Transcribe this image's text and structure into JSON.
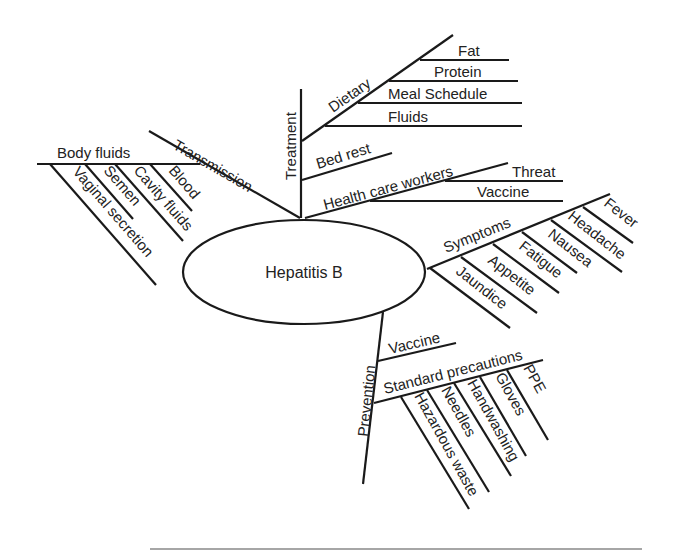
{
  "diagram": {
    "type": "mind-map",
    "center": {
      "label": "Hepatitis B"
    },
    "branches": {
      "transmission": {
        "label": "Transmission",
        "children": {
          "body_fluids": {
            "label": "Body fluids",
            "items": [
              "Vaginal secretion",
              "Semen",
              "Cavity fluids",
              "Blood"
            ]
          }
        }
      },
      "treatment": {
        "label": "Treatment",
        "children": {
          "dietary": {
            "label": "Dietary",
            "items": [
              "Fat",
              "Protein",
              "Meal Schedule",
              "Fluids"
            ]
          },
          "bed_rest": {
            "label": "Bed rest"
          },
          "health_care_workers": {
            "label": "Health care workers",
            "items": [
              "Threat",
              "Vaccine"
            ]
          }
        }
      },
      "symptoms": {
        "label": "Symptoms",
        "items": [
          "Jaundice",
          "Appetite",
          "Fatigue",
          "Nausea",
          "Headache",
          "Fever"
        ]
      },
      "prevention": {
        "label": "Prevention",
        "children": {
          "vaccine": {
            "label": "Vaccine"
          },
          "standard_precautions": {
            "label": "Standard precautions",
            "items": [
              "Hazardous waste",
              "Needles",
              "Handwashing",
              "Gloves",
              "PPE"
            ]
          }
        }
      }
    }
  }
}
